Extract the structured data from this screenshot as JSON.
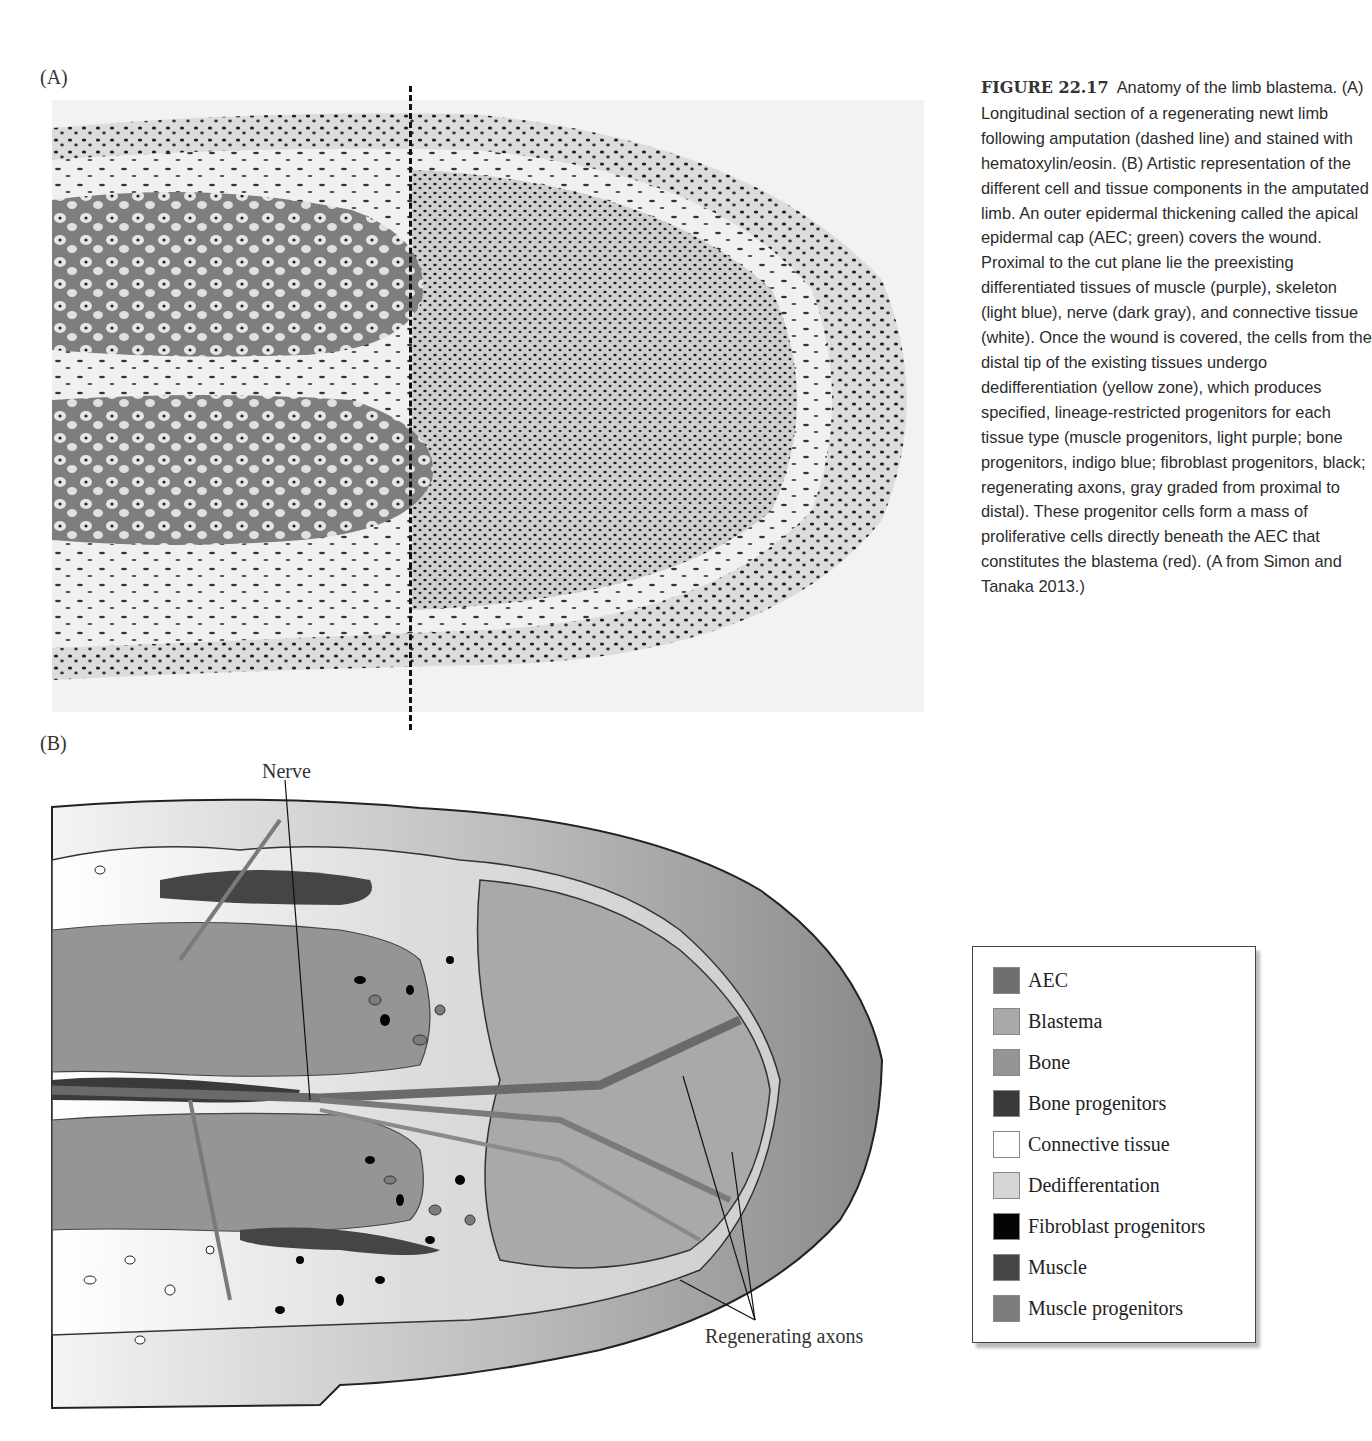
{
  "figure": {
    "panel_a_label": "(A)",
    "panel_b_label": "(B)",
    "callouts": {
      "nerve": "Nerve",
      "regenerating_axons": "Regenerating axons"
    }
  },
  "caption": {
    "figure_number": "FIGURE 22.17",
    "text": "Anatomy of the limb blastema. (A) Longitudinal section of a regenerating newt limb following amputation (dashed line) and stained with hematoxylin/eosin. (B) Artistic representation of the different cell and tissue components in the amputated limb. An outer epidermal thickening called the apical epidermal cap (AEC; green) covers the wound. Proximal to the cut plane lie the preexisting differentiated tissues of muscle (purple), skeleton (light blue), nerve (dark gray), and connective tissue (white). Once the wound is covered, the cells from the distal tip of the existing tissues undergo dedifferentiation (yellow zone), which produces specified, lineage-restricted progenitors for each tissue type (muscle progenitors, light purple; bone progenitors, indigo blue; fibroblast progenitors, black; regenerating axons, gray graded from proximal to distal). These progenitor cells form a mass of proliferative cells directly beneath the AEC that constitutes the blastema (red). (A from Simon and Tanaka 2013.)"
  },
  "legend": {
    "items": [
      {
        "label": "AEC",
        "color": "#6e6e6e"
      },
      {
        "label": "Blastema",
        "color": "#a9a9a9"
      },
      {
        "label": "Bone",
        "color": "#959595"
      },
      {
        "label": "Bone progenitors",
        "color": "#3a3a3a"
      },
      {
        "label": "Connective tissue",
        "color": "#ffffff"
      },
      {
        "label": "Dedifferentation",
        "color": "#d6d6d6"
      },
      {
        "label": "Fibroblast progenitors",
        "color": "#050505"
      },
      {
        "label": "Muscle",
        "color": "#454545"
      },
      {
        "label": "Muscle progenitors",
        "color": "#7c7c7c"
      }
    ]
  }
}
